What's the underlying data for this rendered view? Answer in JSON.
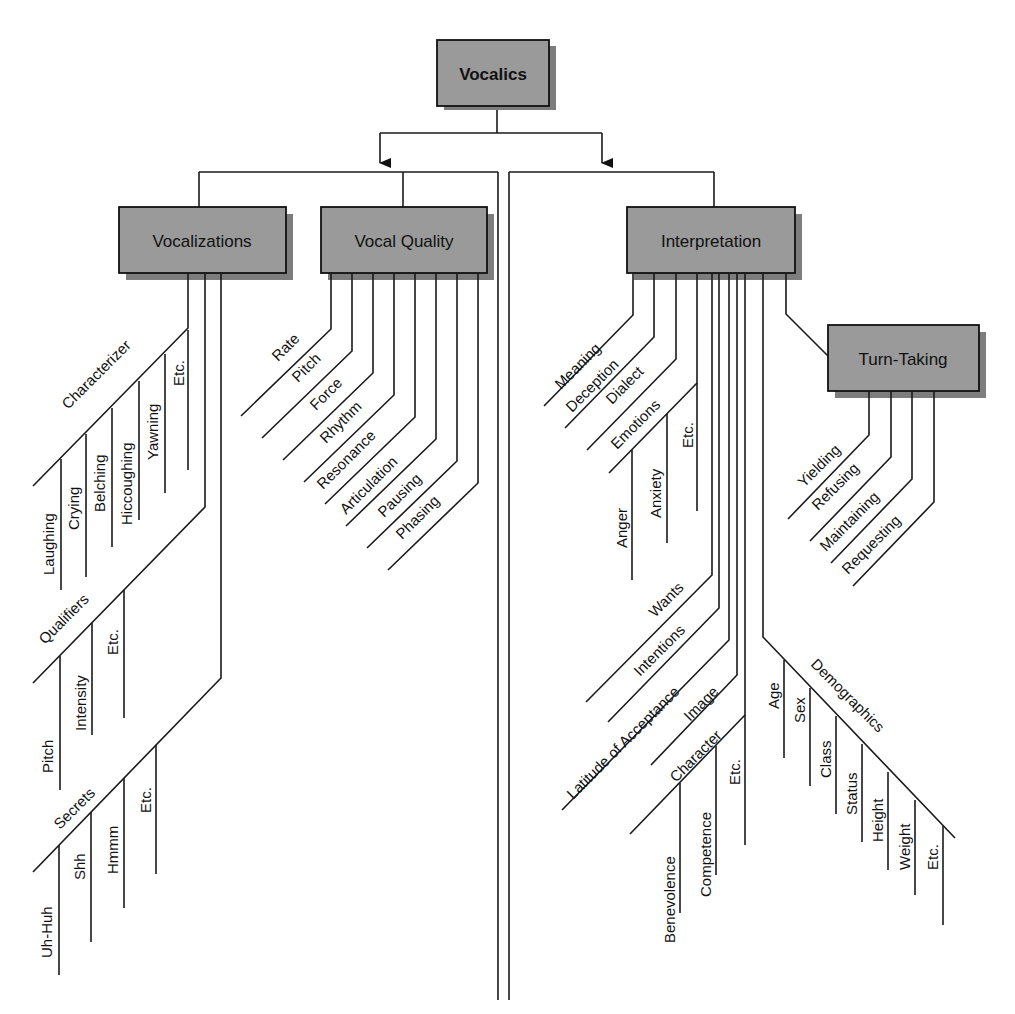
{
  "title": "Vocalics",
  "colors": {
    "box_fill": "#9a9a9a",
    "box_shadow": "#7d7d7d",
    "line": "#1a1a1a",
    "text": "#111111"
  },
  "nodes": {
    "root": "Vocalics",
    "vocalizations": "Vocalizations",
    "vocal_quality": "Vocal Quality",
    "interpretation": "Interpretation",
    "turn_taking": "Turn-Taking"
  },
  "vocalizations": {
    "characterizer": {
      "label": "Characterizer",
      "items": [
        "Laughing",
        "Crying",
        "Belching",
        "Hiccoughing",
        "Yawning",
        "Etc."
      ]
    },
    "qualifiers": {
      "label": "Qualifiers",
      "items": [
        "Pitch",
        "Intensity",
        "Etc."
      ]
    },
    "secrets": {
      "label": "Secrets",
      "items": [
        "Uh-Huh",
        "Shh",
        "Hmmm",
        "Etc."
      ]
    }
  },
  "vocal_quality": {
    "items": [
      "Rate",
      "Pitch",
      "Force",
      "Rhythm",
      "Resonance",
      "Articulation",
      "Pausing",
      "Phasing"
    ]
  },
  "interpretation": {
    "items_upper": [
      "Meaning",
      "Deception",
      "Dialect"
    ],
    "emotions": {
      "label": "Emotions",
      "items": [
        "Anger",
        "Anxiety",
        "Etc."
      ]
    },
    "items_lower": [
      "Wants",
      "Intentions",
      "Latitude of Acceptance",
      "Image"
    ],
    "character": {
      "label": "Character",
      "items": [
        "Benevolence",
        "Competence",
        "Etc."
      ]
    },
    "demographics": {
      "label": "Demographics",
      "items": [
        "Age",
        "Sex",
        "Class",
        "Status",
        "Height",
        "Weight",
        "Etc."
      ]
    }
  },
  "turn_taking": {
    "items": [
      "Yielding",
      "Refusing",
      "Maintaining",
      "Requesting"
    ]
  }
}
